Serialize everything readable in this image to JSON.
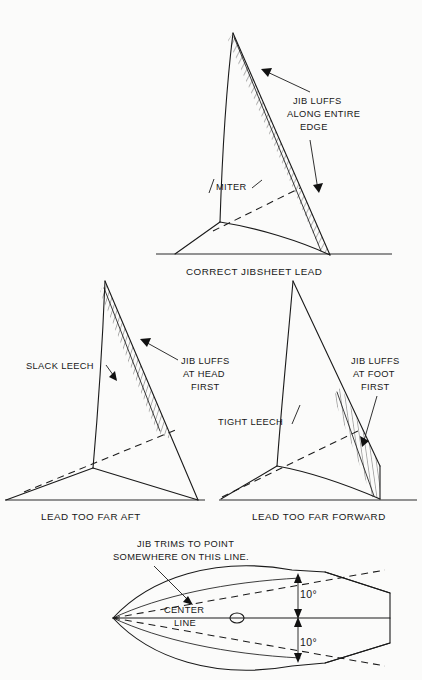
{
  "figure": {
    "title_note": "Jibsheet lead trim diagram",
    "colors": {
      "ink": "#1a1a1a",
      "paper": "#fbfbfa"
    }
  },
  "panels": {
    "top": {
      "caption": "CORRECT JIBSHEET LEAD",
      "labels": {
        "miter": "MITER",
        "luff_line1": "JIB LUFFS",
        "luff_line2": "ALONG ENTIRE",
        "luff_line3": "EDGE"
      }
    },
    "mid_left": {
      "caption": "LEAD TOO FAR AFT",
      "labels": {
        "leech": "SLACK LEECH",
        "luff_line1": "JIB LUFFS",
        "luff_line2": "AT HEAD",
        "luff_line3": "FIRST"
      }
    },
    "mid_right": {
      "caption": "LEAD TOO FAR FORWARD",
      "labels": {
        "leech": "TIGHT LEECH",
        "luff_line1": "JIB LUFFS",
        "luff_line2": "AT FOOT",
        "luff_line3": "FIRST"
      }
    },
    "bottom": {
      "labels": {
        "trim_line1": "JIB TRIMS TO POINT",
        "trim_line2": "SOMEWHERE  ON THIS LINE.",
        "center_line1": "CENTER",
        "center_line2": "LINE",
        "angle_upper": "10°",
        "angle_lower": "10°"
      }
    }
  }
}
